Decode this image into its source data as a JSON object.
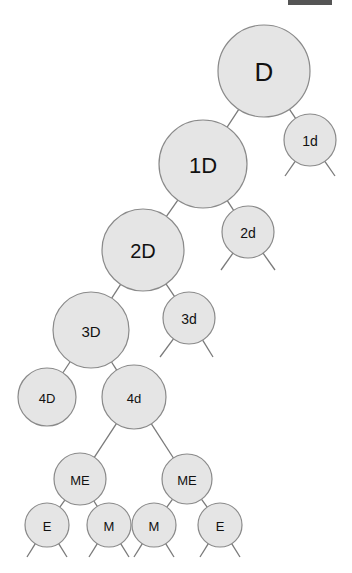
{
  "diagram": {
    "type": "tree",
    "top_bar_color": "#555555",
    "node_fill": "#e5e5e5",
    "node_stroke": "#8a8a8a",
    "edge_color": "#7a7a7a",
    "nodes": [
      {
        "id": "D",
        "label": "D",
        "cx": 264,
        "cy": 71,
        "r": 46,
        "font": 26
      },
      {
        "id": "1d",
        "label": "1d",
        "cx": 310,
        "cy": 140,
        "r": 26,
        "font": 14
      },
      {
        "id": "1D",
        "label": "1D",
        "cx": 203,
        "cy": 164,
        "r": 44,
        "font": 22
      },
      {
        "id": "2d",
        "label": "2d",
        "cx": 248,
        "cy": 232,
        "r": 26,
        "font": 14
      },
      {
        "id": "2D",
        "label": "2D",
        "cx": 143,
        "cy": 250,
        "r": 41,
        "font": 20
      },
      {
        "id": "3d",
        "label": "3d",
        "cx": 189,
        "cy": 318,
        "r": 26,
        "font": 14
      },
      {
        "id": "3D",
        "label": "3D",
        "cx": 91,
        "cy": 330,
        "r": 38,
        "font": 15
      },
      {
        "id": "4D",
        "label": "4D",
        "cx": 47,
        "cy": 397,
        "r": 29,
        "font": 13
      },
      {
        "id": "4d",
        "label": "4d",
        "cx": 134,
        "cy": 397,
        "r": 32,
        "font": 13
      },
      {
        "id": "ME1",
        "label": "ME",
        "cx": 80,
        "cy": 479,
        "r": 26,
        "font": 13
      },
      {
        "id": "ME2",
        "label": "ME",
        "cx": 187,
        "cy": 479,
        "r": 25,
        "font": 13
      },
      {
        "id": "E1",
        "label": "E",
        "cx": 47,
        "cy": 525,
        "r": 22,
        "font": 13
      },
      {
        "id": "M1",
        "label": "M",
        "cx": 109,
        "cy": 525,
        "r": 22,
        "font": 13
      },
      {
        "id": "M2",
        "label": "M",
        "cx": 154,
        "cy": 525,
        "r": 22,
        "font": 13
      },
      {
        "id": "E2",
        "label": "E",
        "cx": 220,
        "cy": 525,
        "r": 22,
        "font": 13
      }
    ],
    "edges": [
      [
        "D",
        "1D"
      ],
      [
        "D",
        "1d"
      ],
      [
        "1D",
        "2D"
      ],
      [
        "1D",
        "2d"
      ],
      [
        "2D",
        "3D"
      ],
      [
        "2D",
        "3d"
      ],
      [
        "3D",
        "4D"
      ],
      [
        "3D",
        "4d"
      ],
      [
        "4d",
        "ME1"
      ],
      [
        "4d",
        "ME2"
      ],
      [
        "ME1",
        "E1"
      ],
      [
        "ME1",
        "M1"
      ],
      [
        "ME2",
        "M2"
      ],
      [
        "ME2",
        "E2"
      ]
    ],
    "dangling_legs": [
      {
        "from": "1d",
        "to": [
          [
            285,
            176
          ],
          [
            335,
            176
          ]
        ]
      },
      {
        "from": "2d",
        "to": [
          [
            221,
            270
          ],
          [
            275,
            270
          ]
        ]
      },
      {
        "from": "3d",
        "to": [
          [
            160,
            357
          ],
          [
            213,
            357
          ]
        ]
      },
      {
        "from": "E1",
        "to": [
          [
            27,
            557
          ],
          [
            67,
            557
          ]
        ]
      },
      {
        "from": "M1",
        "to": [
          [
            89,
            557
          ],
          [
            129,
            557
          ]
        ]
      },
      {
        "from": "M2",
        "to": [
          [
            134,
            557
          ],
          [
            174,
            557
          ]
        ]
      },
      {
        "from": "E2",
        "to": [
          [
            200,
            557
          ],
          [
            240,
            557
          ]
        ]
      }
    ]
  }
}
